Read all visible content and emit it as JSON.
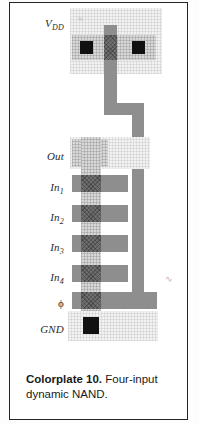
{
  "figure": {
    "caption_label": "Colorplate 10.",
    "caption_text": "Four-input dynamic NAND.",
    "kind": "vlsi-mask-layout"
  },
  "colors": {
    "background": "#ffffff",
    "frame": "#242424",
    "poly_metal": "#8e8e8e",
    "gate_overlap": "#6f6f6f",
    "diffusion": "#d8d8d8",
    "well_wash": "#f2f2f2",
    "contact": "#111111",
    "label_text": "#2b2b2b"
  },
  "labels": [
    {
      "id": "vdd",
      "text": "V",
      "sub": "DD",
      "y": 14
    },
    {
      "id": "out",
      "text": "Out",
      "sub": "",
      "y": 147
    },
    {
      "id": "in1",
      "text": "In",
      "sub": "1",
      "y": 178
    },
    {
      "id": "in2",
      "text": "In",
      "sub": "2",
      "y": 208
    },
    {
      "id": "in3",
      "text": "In",
      "sub": "3",
      "y": 238
    },
    {
      "id": "in4",
      "text": "In",
      "sub": "4",
      "y": 268
    },
    {
      "id": "phi",
      "text": "ϕ",
      "sub": "",
      "y": 296
    },
    {
      "id": "gnd",
      "text": "GND",
      "sub": "",
      "y": 323
    }
  ],
  "annotations": {
    "top_mark": "≈",
    "right_mark": "∿"
  }
}
